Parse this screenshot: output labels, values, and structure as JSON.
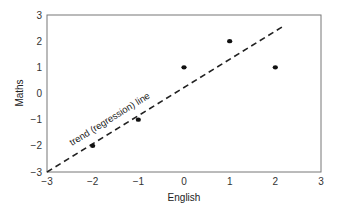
{
  "chart_data": {
    "type": "scatter",
    "title": "",
    "xlabel": "English",
    "ylabel": "Maths",
    "xlim": [
      -3,
      3
    ],
    "ylim": [
      -3,
      3
    ],
    "grid": false,
    "legend": null,
    "x_ticks": [
      "−3",
      "−2",
      "−1",
      "0",
      "1",
      "2",
      "3"
    ],
    "y_ticks": [
      "−3",
      "−2",
      "−1",
      "0",
      "1",
      "2",
      "3"
    ],
    "series": [
      {
        "name": "students",
        "x": [
          -2,
          -1,
          0,
          1,
          2
        ],
        "y": [
          -2,
          -1,
          1,
          2,
          1
        ]
      }
    ],
    "trend_line": {
      "style": "dashed",
      "from": [
        -3,
        -3
      ],
      "to": [
        2.2,
        2.6
      ]
    },
    "annotations": [
      {
        "text": "trend (regression) line",
        "position": "along trend line, lower-left",
        "rotation": "parallel to line"
      }
    ]
  }
}
